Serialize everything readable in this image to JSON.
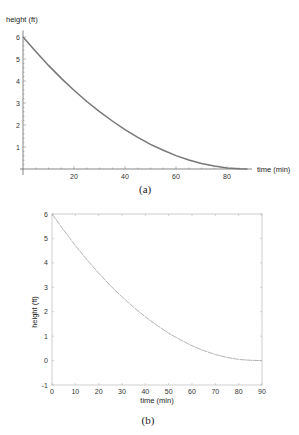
{
  "chart_data": [
    {
      "id": "a",
      "type": "line",
      "caption": "(a)",
      "title": "",
      "xlabel": "time (min)",
      "ylabel": "height (ft)",
      "xlim": [
        0,
        90
      ],
      "ylim": [
        0,
        6.3
      ],
      "x_ticks": [
        20,
        40,
        60,
        80
      ],
      "y_ticks": [
        1,
        2,
        3,
        4,
        5,
        6
      ],
      "grid": false,
      "legend": null,
      "series": [
        {
          "name": "height",
          "color": "#777777",
          "x": [
            0,
            5,
            10,
            15,
            20,
            25,
            30,
            35,
            40,
            45,
            50,
            55,
            60,
            65,
            70,
            75,
            80,
            85,
            88
          ],
          "y": [
            6.0,
            5.34,
            4.71,
            4.12,
            3.58,
            3.07,
            2.61,
            2.18,
            1.79,
            1.44,
            1.12,
            0.85,
            0.61,
            0.41,
            0.25,
            0.13,
            0.05,
            0.01,
            0.0
          ]
        }
      ]
    },
    {
      "id": "b",
      "type": "line",
      "caption": "(b)",
      "title": "",
      "xlabel": "time (min)",
      "ylabel": "height (ft)",
      "xlim": [
        0,
        90
      ],
      "ylim": [
        -1,
        6
      ],
      "x_ticks": [
        0,
        10,
        20,
        30,
        40,
        50,
        60,
        70,
        80,
        90
      ],
      "y_ticks": [
        -1,
        0,
        1,
        2,
        3,
        4,
        5,
        6
      ],
      "grid": false,
      "legend": null,
      "series": [
        {
          "name": "height",
          "color": "#aaaaaa",
          "x": [
            0,
            5,
            10,
            15,
            20,
            25,
            30,
            35,
            40,
            45,
            50,
            55,
            60,
            65,
            70,
            75,
            80,
            85,
            90
          ],
          "y": [
            6.0,
            5.34,
            4.71,
            4.12,
            3.58,
            3.07,
            2.61,
            2.18,
            1.79,
            1.44,
            1.12,
            0.85,
            0.61,
            0.41,
            0.25,
            0.13,
            0.05,
            0.01,
            0.0
          ]
        }
      ]
    }
  ]
}
